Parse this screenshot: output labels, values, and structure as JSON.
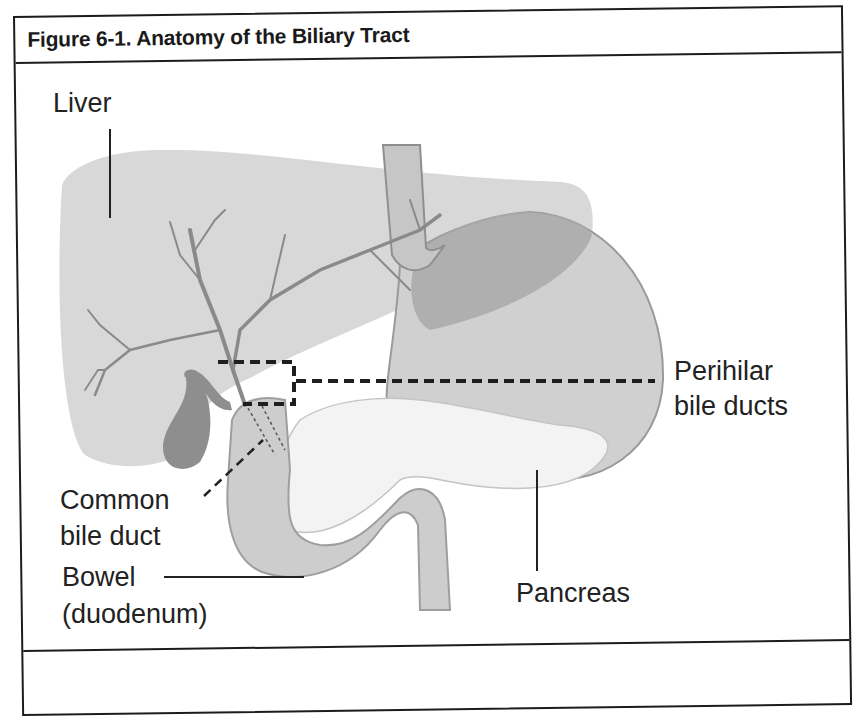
{
  "figure": {
    "title": "Figure 6-1. Anatomy of the Biliary Tract",
    "caption_partially_visible": true
  },
  "labels": {
    "liver": "Liver",
    "perihilar_line1": "Perihilar",
    "perihilar_line2": "bile ducts",
    "common_line1": "Common",
    "common_line2": "bile duct",
    "bowel_line1": "Bowel",
    "bowel_line2": "(duodenum)",
    "pancreas": "Pancreas"
  },
  "structures": [
    {
      "name": "liver",
      "fill": "#d6d6d6"
    },
    {
      "name": "gallbladder",
      "fill": "#8e8e8e"
    },
    {
      "name": "stomach",
      "fill": "#cfcfcf"
    },
    {
      "name": "esophagus",
      "fill": "#c9c9c9"
    },
    {
      "name": "duodenum",
      "fill": "#cdcdcd"
    },
    {
      "name": "pancreas",
      "fill": "#f2f2f2"
    },
    {
      "name": "bile-ducts",
      "stroke": "#8a8a8a"
    }
  ],
  "colors": {
    "frame": "#1c1c1c",
    "text": "#222222",
    "dashed_box": "#1e1e1e"
  }
}
